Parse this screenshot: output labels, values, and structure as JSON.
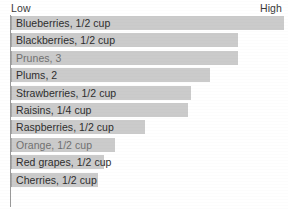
{
  "chart_data": {
    "type": "bar",
    "orientation": "horizontal",
    "title": "",
    "xlabel": "",
    "ylabel": "",
    "axis_low_label": "Low",
    "axis_high_label": "High",
    "grid": false,
    "legend": "none",
    "xlim": [
      0,
      100
    ],
    "categories": [
      "Blueberries, 1/2 cup",
      "Blackberries, 1/2 cup",
      "Prunes, 3",
      "Plums, 2",
      "Strawberries, 1/2 cup",
      "Raisins, 1/4 cup",
      "Raspberries, 1/2 cup",
      "Orange, 1/2 cup",
      "Red grapes, 1/2 cup",
      "Cherries, 1/2 cup"
    ],
    "values": [
      100,
      83,
      83,
      73,
      66,
      65,
      49,
      38,
      34,
      32
    ],
    "bars": [
      {
        "label": "Blueberries, 1/2 cup",
        "value": 100,
        "width_pct": 100,
        "degraded": false
      },
      {
        "label": "Blackberries, 1/2 cup",
        "value": 83,
        "width_pct": 83,
        "degraded": false
      },
      {
        "label": "Prunes, 3",
        "value": 83,
        "width_pct": 83,
        "degraded": true
      },
      {
        "label": "Plums, 2",
        "value": 73,
        "width_pct": 73,
        "degraded": false
      },
      {
        "label": "Strawberries, 1/2 cup",
        "value": 66,
        "width_pct": 66,
        "degraded": false
      },
      {
        "label": "Raisins, 1/4 cup",
        "value": 65,
        "width_pct": 65,
        "degraded": false
      },
      {
        "label": "Raspberries, 1/2 cup",
        "value": 49,
        "width_pct": 49,
        "degraded": false
      },
      {
        "label": "Orange, 1/2 cup",
        "value": 38,
        "width_pct": 38,
        "degraded": true
      },
      {
        "label": "Red grapes, 1/2 cup",
        "value": 34,
        "width_pct": 34,
        "degraded": false
      },
      {
        "label": "Cherries, 1/2 cup",
        "value": 32,
        "width_pct": 32,
        "degraded": false
      }
    ]
  },
  "colors": {
    "bar_fill": "#cbcbcb",
    "bar_edge": "#a8a8a8",
    "axis_line": "#9a9a9a",
    "text": "#2e2e2e",
    "background": "#ffffff"
  }
}
